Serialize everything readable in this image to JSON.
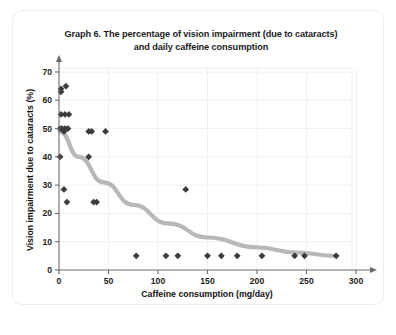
{
  "card": {
    "title": "Graph 6. The percentage of vision impairment (due to cataracts) and daily caffeine consumption"
  },
  "chart_data": {
    "type": "scatter",
    "title": "Graph 6. The percentage of vision impairment (due to cataracts) and daily caffeine consumption",
    "title_line1": "Graph 6. The percentage of vision impairment (due to cataracts)",
    "title_line2": "and daily caffeine consumption",
    "xlabel": "Caffeine consumption (mg/day)",
    "ylabel": "Vision impairment due to cataracts (%)",
    "xlim": [
      0,
      300
    ],
    "ylim": [
      0,
      70
    ],
    "xticks": [
      0,
      50,
      100,
      150,
      200,
      250,
      300
    ],
    "yticks": [
      0,
      10,
      20,
      30,
      40,
      50,
      60,
      70
    ],
    "xtick_labels": [
      "0",
      "50",
      "100",
      "150",
      "200",
      "250",
      "300"
    ],
    "ytick_labels": [
      "0",
      "10",
      "20",
      "30",
      "40",
      "50",
      "60",
      "70"
    ],
    "grid": true,
    "legend": "none",
    "marker_shape": "diamond",
    "marker_color": "#3c3c3c",
    "trend_color": "#b8b8b8",
    "points": [
      {
        "x": 2,
        "y": 63
      },
      {
        "x": 2,
        "y": 64
      },
      {
        "x": 7,
        "y": 65
      },
      {
        "x": 2,
        "y": 55
      },
      {
        "x": 6,
        "y": 55
      },
      {
        "x": 10,
        "y": 55
      },
      {
        "x": 1,
        "y": 50
      },
      {
        "x": 3,
        "y": 50
      },
      {
        "x": 6,
        "y": 50
      },
      {
        "x": 9,
        "y": 50
      },
      {
        "x": 5,
        "y": 49
      },
      {
        "x": 30,
        "y": 49
      },
      {
        "x": 33,
        "y": 49
      },
      {
        "x": 47,
        "y": 49
      },
      {
        "x": 1,
        "y": 40
      },
      {
        "x": 30,
        "y": 40
      },
      {
        "x": 5,
        "y": 28.5
      },
      {
        "x": 128,
        "y": 28.5
      },
      {
        "x": 8,
        "y": 24
      },
      {
        "x": 35,
        "y": 24
      },
      {
        "x": 38,
        "y": 24
      },
      {
        "x": 78,
        "y": 5
      },
      {
        "x": 108,
        "y": 5
      },
      {
        "x": 120,
        "y": 5
      },
      {
        "x": 150,
        "y": 5
      },
      {
        "x": 164,
        "y": 5
      },
      {
        "x": 180,
        "y": 5
      },
      {
        "x": 205,
        "y": 5
      },
      {
        "x": 238,
        "y": 5
      },
      {
        "x": 248,
        "y": 5
      },
      {
        "x": 280,
        "y": 5
      }
    ],
    "trend_line": {
      "description": "decreasing power/exponential curve",
      "points": [
        {
          "x": 1,
          "y": 49
        },
        {
          "x": 20,
          "y": 40
        },
        {
          "x": 45,
          "y": 31
        },
        {
          "x": 75,
          "y": 23
        },
        {
          "x": 110,
          "y": 16.5
        },
        {
          "x": 150,
          "y": 11.5
        },
        {
          "x": 200,
          "y": 8
        },
        {
          "x": 240,
          "y": 6.2
        },
        {
          "x": 280,
          "y": 5
        }
      ]
    }
  }
}
